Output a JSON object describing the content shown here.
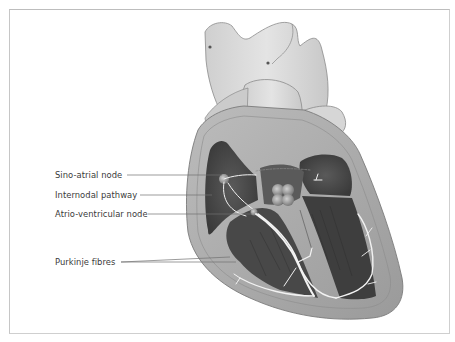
{
  "diagram": {
    "labels": [
      {
        "id": "sa-node",
        "text": "Sino-atrial node",
        "y": 170
      },
      {
        "id": "internodal",
        "text": "Internodal pathway",
        "y": 190
      },
      {
        "id": "av-node",
        "text": "Atrio-ventricular node",
        "y": 209
      },
      {
        "id": "purkinje",
        "text": "Purkinje fibres",
        "y": 257
      }
    ]
  },
  "colors": {
    "frame": "#cfcfcf",
    "label_text": "#3a3a3a",
    "leader_line": "#707070",
    "vessel_light": "#d9d9d9",
    "wall_mid": "#a9a9a9",
    "chamber_dark": "#4a4a4a",
    "conduction_path": "#f2f2f2"
  }
}
